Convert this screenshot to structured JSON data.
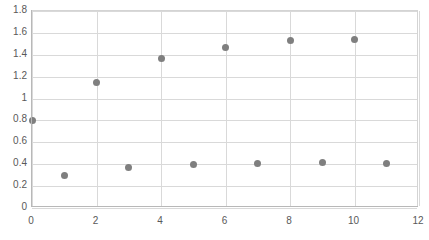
{
  "chart_data": {
    "type": "scatter",
    "title": "",
    "subtitle": "",
    "xlabel": "",
    "ylabel": "",
    "xlim": [
      0,
      12
    ],
    "ylim": [
      0,
      1.8
    ],
    "x_tick_interval": 2,
    "y_tick_interval": 0.2,
    "x_gridline_interval": 2,
    "grid": "horizontal-and-vertical",
    "legend": "none",
    "marker_color": "#7f7f7f",
    "marker_shape": "circle",
    "plot_border_color": "#d4d4d4",
    "gridline_color": "#d9d9d9",
    "axis_label_color": "#595959",
    "x_ticks": [
      "0",
      "2",
      "4",
      "6",
      "8",
      "10",
      "12"
    ],
    "x_tick_values": [
      0,
      2,
      4,
      6,
      8,
      10,
      12
    ],
    "y_ticks": [
      "0",
      "0.2",
      "0.4",
      "0.6",
      "0.8",
      "1",
      "1.2",
      "1.4",
      "1.6",
      "1.8"
    ],
    "y_tick_values": [
      0,
      0.2,
      0.4,
      0.6,
      0.8,
      1,
      1.2,
      1.4,
      1.6,
      1.8
    ],
    "x_gridline_values": [
      0,
      2,
      4,
      6,
      8,
      10,
      12
    ],
    "x": [
      0,
      1,
      2,
      3,
      4,
      5,
      6,
      7,
      8,
      9,
      10,
      11
    ],
    "values": [
      0.8,
      0.3,
      1.15,
      0.37,
      1.37,
      0.4,
      1.47,
      0.41,
      1.53,
      0.42,
      1.54,
      0.41
    ],
    "points": [
      {
        "x": 0,
        "y": 0.8
      },
      {
        "x": 1,
        "y": 0.3
      },
      {
        "x": 2,
        "y": 1.15
      },
      {
        "x": 3,
        "y": 0.37
      },
      {
        "x": 4,
        "y": 1.37
      },
      {
        "x": 5,
        "y": 0.4
      },
      {
        "x": 6,
        "y": 1.47
      },
      {
        "x": 7,
        "y": 0.41
      },
      {
        "x": 8,
        "y": 1.53
      },
      {
        "x": 9,
        "y": 0.42
      },
      {
        "x": 10,
        "y": 1.54
      },
      {
        "x": 11,
        "y": 0.41
      }
    ]
  }
}
